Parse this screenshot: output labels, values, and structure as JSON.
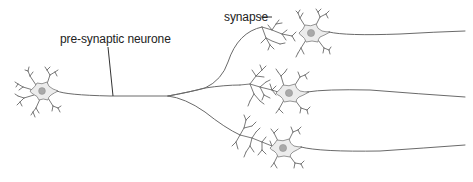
{
  "diagram": {
    "type": "neuron-divergence",
    "labels": {
      "pre_synaptic": "pre-synaptic neurone",
      "synapse": "synapse"
    },
    "colors": {
      "stroke": "#6a6a6a",
      "soma_fill": "#ececec",
      "nucleus": "#a9a9a9",
      "text": "#222222",
      "background": "#ffffff"
    },
    "neurons": [
      {
        "id": "pre-synaptic",
        "soma_center": [
          42,
          91
        ]
      },
      {
        "id": "post-synaptic-top",
        "soma_center": [
          311,
          33
        ]
      },
      {
        "id": "post-synaptic-middle",
        "soma_center": [
          289,
          93
        ]
      },
      {
        "id": "post-synaptic-bottom",
        "soma_center": [
          283,
          148
        ]
      }
    ]
  }
}
